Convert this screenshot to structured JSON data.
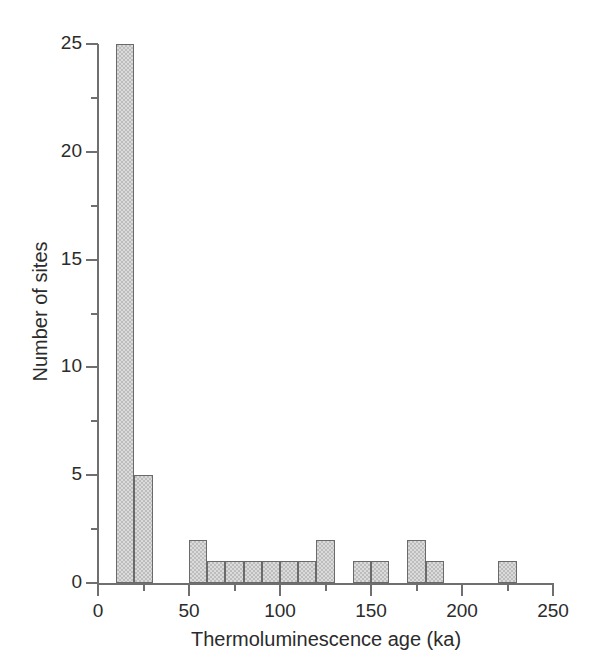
{
  "chart_data": {
    "type": "bar",
    "title": "",
    "subtitle": "",
    "xlabel": "Thermoluminescence age (ka)",
    "ylabel": "Number of sites",
    "xlim": [
      0,
      250
    ],
    "ylim": [
      0,
      25
    ],
    "bin_width": 10,
    "grid": false,
    "legend": null,
    "x_major_ticks": [
      0,
      50,
      100,
      150,
      200,
      250
    ],
    "x_minor_ticks": [
      25,
      75,
      125,
      175,
      225
    ],
    "x_tick_labels": [
      "0",
      "50",
      "100",
      "150",
      "200",
      "250"
    ],
    "y_major_ticks": [
      0,
      5,
      10,
      15,
      20,
      25
    ],
    "y_minor_ticks": [
      2.5,
      7.5,
      12.5,
      17.5,
      22.5
    ],
    "y_tick_labels": [
      "0",
      "5",
      "10",
      "15",
      "20",
      "25"
    ],
    "bar_fill_color": "#bdbdbd",
    "bar_edge_color": "#6a6a6a",
    "axis_color": "#6f6f6f",
    "bins": [
      {
        "x0": 10,
        "x1": 20,
        "value": 25
      },
      {
        "x0": 20,
        "x1": 30,
        "value": 5
      },
      {
        "x0": 50,
        "x1": 60,
        "value": 2
      },
      {
        "x0": 60,
        "x1": 70,
        "value": 1
      },
      {
        "x0": 70,
        "x1": 80,
        "value": 1
      },
      {
        "x0": 80,
        "x1": 90,
        "value": 1
      },
      {
        "x0": 90,
        "x1": 100,
        "value": 1
      },
      {
        "x0": 100,
        "x1": 110,
        "value": 1
      },
      {
        "x0": 110,
        "x1": 120,
        "value": 1
      },
      {
        "x0": 120,
        "x1": 130,
        "value": 2
      },
      {
        "x0": 140,
        "x1": 150,
        "value": 1
      },
      {
        "x0": 150,
        "x1": 160,
        "value": 1
      },
      {
        "x0": 170,
        "x1": 180,
        "value": 2
      },
      {
        "x0": 180,
        "x1": 190,
        "value": 1
      },
      {
        "x0": 220,
        "x1": 230,
        "value": 1
      }
    ],
    "categories": [
      "10-20",
      "20-30",
      "50-60",
      "60-70",
      "70-80",
      "80-90",
      "90-100",
      "100-110",
      "110-120",
      "120-130",
      "140-150",
      "150-160",
      "170-180",
      "180-190",
      "220-230"
    ],
    "values": [
      25,
      5,
      2,
      1,
      1,
      1,
      1,
      1,
      1,
      2,
      1,
      1,
      2,
      1,
      1
    ]
  }
}
